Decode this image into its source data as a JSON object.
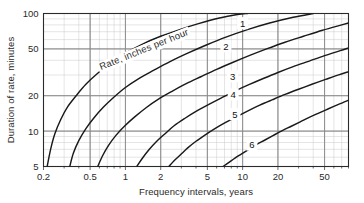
{
  "chart_data": {
    "type": "line",
    "title": "",
    "xlabel": "Frequency intervals, years",
    "ylabel": "Duration of rate, minutes",
    "xscale": "log",
    "yscale": "log",
    "xlim": [
      0.2,
      80
    ],
    "ylim": [
      5,
      100
    ],
    "grid": true,
    "grid_minor": true,
    "legend": "none",
    "xticks": [
      0.2,
      0.5,
      1,
      2,
      5,
      10,
      20,
      50
    ],
    "xticklabels": [
      "0.2",
      "0.5",
      "1",
      "2",
      "5",
      "10",
      "20",
      "50"
    ],
    "yticks": [
      5,
      10,
      20,
      50,
      100
    ],
    "yticklabels": [
      "5",
      "10",
      "20",
      "50",
      "100"
    ],
    "annotations": [
      {
        "text": "Rate, inches per hour",
        "x": 0.62,
        "y": 33,
        "rotation": -22
      }
    ],
    "series": [
      {
        "name": "1",
        "label": "1",
        "label_x": 10.0,
        "label_y": 82,
        "points": [
          [
            0.215,
            5
          ],
          [
            0.23,
            7
          ],
          [
            0.25,
            9.5
          ],
          [
            0.28,
            12.5
          ],
          [
            0.32,
            16
          ],
          [
            0.38,
            20
          ],
          [
            0.46,
            25
          ],
          [
            0.58,
            31
          ],
          [
            0.75,
            38
          ],
          [
            1.0,
            46
          ],
          [
            1.4,
            55
          ],
          [
            2.0,
            64
          ],
          [
            2.9,
            73
          ],
          [
            4.2,
            82
          ],
          [
            6.2,
            91
          ],
          [
            9.0,
            98
          ],
          [
            11.0,
            100
          ]
        ]
      },
      {
        "name": "2",
        "label": "2",
        "label_x": 7.2,
        "label_y": 52,
        "points": [
          [
            0.335,
            5
          ],
          [
            0.36,
            6.5
          ],
          [
            0.4,
            8.3
          ],
          [
            0.46,
            10.5
          ],
          [
            0.54,
            13
          ],
          [
            0.65,
            16
          ],
          [
            0.8,
            19.5
          ],
          [
            1.0,
            23.5
          ],
          [
            1.3,
            28
          ],
          [
            1.75,
            33
          ],
          [
            2.4,
            39
          ],
          [
            3.4,
            46
          ],
          [
            4.9,
            54
          ],
          [
            7.2,
            63
          ],
          [
            11.0,
            73
          ],
          [
            17.0,
            83
          ],
          [
            27.0,
            93
          ],
          [
            40.0,
            100
          ]
        ]
      },
      {
        "name": "3",
        "label": "3",
        "label_x": 8.2,
        "label_y": 29,
        "points": [
          [
            0.58,
            5
          ],
          [
            0.64,
            6.2
          ],
          [
            0.72,
            7.6
          ],
          [
            0.83,
            9.2
          ],
          [
            0.98,
            11
          ],
          [
            1.2,
            13.2
          ],
          [
            1.5,
            15.8
          ],
          [
            1.9,
            18.6
          ],
          [
            2.5,
            21.8
          ],
          [
            3.3,
            25.3
          ],
          [
            4.4,
            29
          ],
          [
            6.0,
            33.5
          ],
          [
            8.3,
            38.5
          ],
          [
            11.5,
            44
          ],
          [
            16.0,
            50
          ],
          [
            23.0,
            57
          ],
          [
            33.0,
            64
          ],
          [
            48.0,
            72
          ],
          [
            70.0,
            80
          ],
          [
            80.0,
            83
          ]
        ]
      },
      {
        "name": "4",
        "label": "4",
        "label_x": 8.3,
        "label_y": 20.3,
        "points": [
          [
            1.25,
            5
          ],
          [
            1.4,
            5.9
          ],
          [
            1.6,
            7.0
          ],
          [
            1.85,
            8.2
          ],
          [
            2.2,
            9.6
          ],
          [
            2.6,
            11.1
          ],
          [
            3.2,
            12.8
          ],
          [
            4.0,
            14.7
          ],
          [
            5.1,
            16.8
          ],
          [
            6.6,
            19.2
          ],
          [
            8.6,
            21.9
          ],
          [
            11.3,
            24.8
          ],
          [
            15.0,
            28.0
          ],
          [
            20.0,
            31.5
          ],
          [
            27.0,
            35.3
          ],
          [
            37.0,
            39.4
          ],
          [
            50.0,
            43.8
          ],
          [
            68.0,
            48.3
          ],
          [
            80.0,
            51.0
          ]
        ]
      },
      {
        "name": "5",
        "label": "5",
        "label_x": 8.6,
        "label_y": 13.8,
        "points": [
          [
            2.35,
            5
          ],
          [
            2.6,
            5.6
          ],
          [
            2.95,
            6.3
          ],
          [
            3.4,
            7.2
          ],
          [
            4.0,
            8.2
          ],
          [
            4.8,
            9.3
          ],
          [
            5.8,
            10.5
          ],
          [
            7.1,
            11.8
          ],
          [
            8.8,
            13.2
          ],
          [
            11.0,
            14.8
          ],
          [
            14.0,
            16.6
          ],
          [
            18.0,
            18.5
          ],
          [
            23.0,
            20.5
          ],
          [
            30.0,
            22.7
          ],
          [
            39.0,
            25.0
          ],
          [
            51.0,
            27.5
          ],
          [
            66.0,
            30.1
          ],
          [
            80.0,
            32.0
          ]
        ]
      },
      {
        "name": "6",
        "label": "6",
        "label_x": 12.0,
        "label_y": 7.6,
        "points": [
          [
            6.8,
            5
          ],
          [
            7.6,
            5.4
          ],
          [
            8.6,
            5.9
          ],
          [
            9.8,
            6.4
          ],
          [
            11.3,
            7.0
          ],
          [
            13.2,
            7.7
          ],
          [
            15.5,
            8.4
          ],
          [
            18.3,
            9.2
          ],
          [
            21.8,
            10.1
          ],
          [
            26.0,
            11.0
          ],
          [
            31.0,
            12.0
          ],
          [
            37.0,
            13.1
          ],
          [
            45.0,
            14.3
          ],
          [
            54.0,
            15.5
          ],
          [
            65.0,
            16.8
          ],
          [
            80.0,
            18.3
          ]
        ]
      }
    ]
  },
  "axes": {
    "x_title": "Frequency intervals, years",
    "y_title": "Duration of rate, minutes"
  },
  "colors": {
    "curve": "#1a1a1a",
    "grid_major": "#8a8a8a",
    "grid_minor": "#c4c4c4",
    "frame": "#2a2a2a",
    "text": "#2a2a2a",
    "background": "#ffffff"
  }
}
